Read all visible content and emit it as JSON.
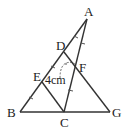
{
  "diagram": {
    "points": {
      "A": "A",
      "B": "B",
      "C": "C",
      "D": "D",
      "E": "E",
      "F": "F",
      "G": "G"
    },
    "measurement_label": "4cm",
    "segments": [
      "AB",
      "BG",
      "AC",
      "DG",
      "EC"
    ],
    "equal_marks": {
      "AD_DE_EB": "single tick",
      "AF_FC": "single tick"
    },
    "colors": {
      "line": "#333333",
      "text": "#222222",
      "background": "#ffffff"
    }
  }
}
